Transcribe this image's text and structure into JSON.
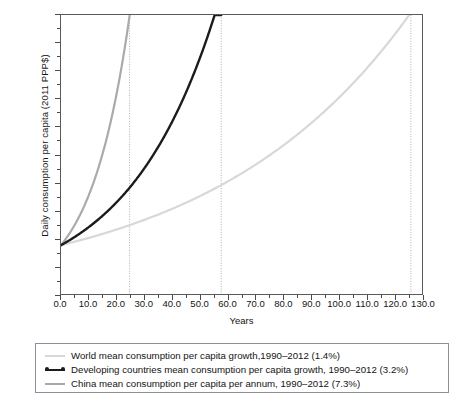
{
  "chart_data": {
    "type": "line",
    "title": "",
    "xlabel": "Years",
    "ylabel": "Daily consumption per capita (2011 PPP$)",
    "xlim": [
      0,
      130
    ],
    "ylim": [
      0,
      10
    ],
    "xticks": [
      "0.0",
      "10.0",
      "20.0",
      "30.0",
      "40.0",
      "50.0",
      "60.0",
      "70.0",
      "80.0",
      "90.0",
      "100.0",
      "110.0",
      "120.0",
      "130.0"
    ],
    "xtick_values": [
      0,
      10,
      20,
      30,
      40,
      50,
      60,
      70,
      80,
      90,
      100,
      110,
      120,
      130
    ],
    "xminor_step": 5,
    "yticks": [
      "0.0",
      "1.0",
      "2.0",
      "3.0",
      "4.0",
      "5.0",
      "6.0",
      "7.0",
      "8.0",
      "9.0",
      "10.0"
    ],
    "ytick_values": [
      0,
      1,
      2,
      3,
      4,
      5,
      6,
      7,
      8,
      9,
      10
    ],
    "grid": false,
    "legend_position": "below",
    "start_value": 1.75,
    "reference_lines": [
      {
        "name": "china-threshold",
        "x": 24.7,
        "style": "dotted"
      },
      {
        "name": "developing-threshold",
        "x": 57.7,
        "style": "dotted"
      },
      {
        "name": "world-threshold",
        "x": 126.0,
        "style": "dotted"
      }
    ],
    "series": [
      {
        "name": "World mean consumption per capita growth,1990–2012 (1.4%)",
        "rate_percent": 1.4,
        "color": "#d8d8d8",
        "width": 2.2,
        "start": 1.75,
        "reaches_10_at_years": 126.0,
        "x": [
          0,
          10,
          20,
          30,
          40,
          50,
          60,
          70,
          80,
          90,
          100,
          110,
          120,
          126
        ],
        "values": [
          1.75,
          2.01,
          2.31,
          2.66,
          3.05,
          3.51,
          4.03,
          4.63,
          5.32,
          6.11,
          7.02,
          8.07,
          9.27,
          10.0
        ]
      },
      {
        "name": "Developing countries mean consumption per capita growth, 1990–2012 (3.2%)",
        "rate_percent": 3.2,
        "color": "#1c1c1c",
        "width": 2.4,
        "start": 1.75,
        "reaches_10_at_years": 57.7,
        "x": [
          0,
          5,
          10,
          15,
          20,
          25,
          30,
          35,
          40,
          45,
          50,
          55,
          57.7
        ],
        "values": [
          1.75,
          2.05,
          2.4,
          2.81,
          3.29,
          3.85,
          4.51,
          5.28,
          6.18,
          7.24,
          8.47,
          9.92,
          10.0
        ]
      },
      {
        "name": "China mean consumption per capita per annum, 1990–2012 (7.3%)",
        "rate_percent": 7.3,
        "color": "#aaaaaa",
        "width": 2.2,
        "start": 1.75,
        "reaches_10_at_years": 24.7,
        "x": [
          0,
          2.5,
          5,
          7.5,
          10,
          12.5,
          15,
          17.5,
          20,
          22.5,
          24.7
        ],
        "values": [
          1.75,
          2.09,
          2.49,
          2.97,
          3.55,
          4.24,
          5.06,
          6.04,
          7.21,
          8.61,
          10.0
        ]
      }
    ]
  },
  "legend": {
    "entries": [
      {
        "marker": "line-swatch-light",
        "label": "World mean consumption per capita growth,1990–2012 (1.4%)",
        "color": "#d8d8d8"
      },
      {
        "marker": "line-swatch-dark",
        "label": "Developing countries mean consumption per capita growth, 1990–2012 (3.2%)",
        "color": "#1c1c1c"
      },
      {
        "marker": "line-swatch-mid",
        "label": "China mean consumption per capita per annum, 1990–2012 (7.3%)",
        "color": "#aaaaaa"
      }
    ]
  },
  "axes": {
    "x_title": "Years",
    "y_title": "Daily consumption per capita (2011 PPP$)"
  }
}
